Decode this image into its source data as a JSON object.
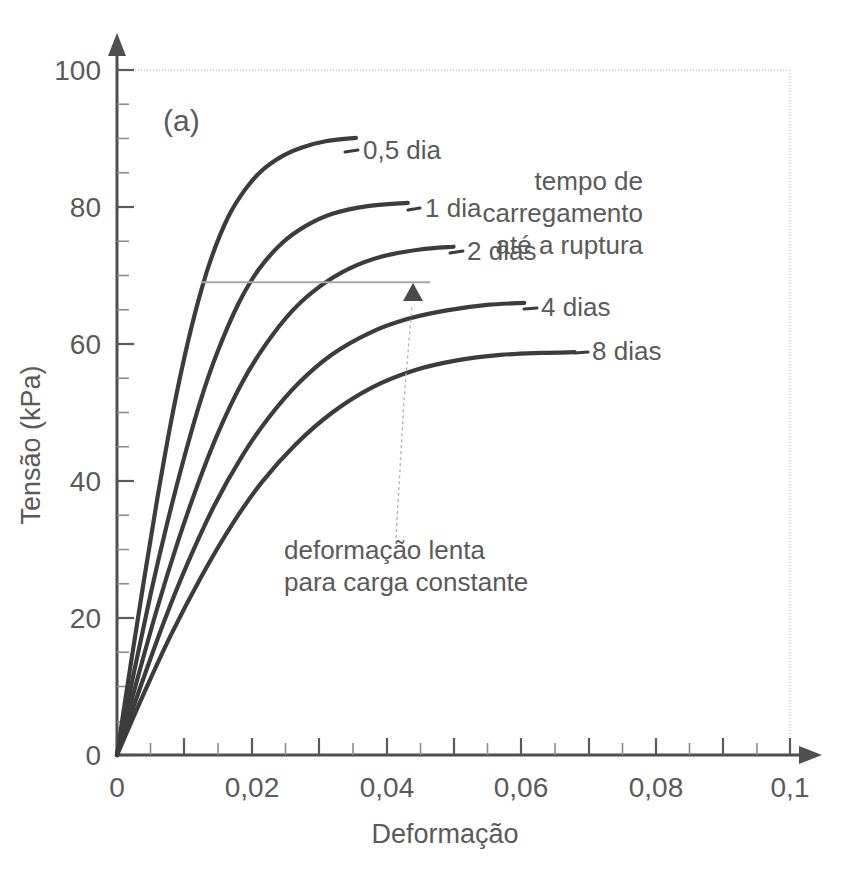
{
  "figure": {
    "panel_label": "(a)",
    "background_color": "#ffffff",
    "ink_color": "#4a4a4a"
  },
  "chart_data": {
    "type": "line",
    "title": "",
    "subtitle": "",
    "panel": "(a)",
    "xlabel": "Deformação",
    "ylabel": "Tensão (kPa)",
    "xlim": [
      0,
      0.1
    ],
    "ylim": [
      0,
      100
    ],
    "x_major_ticks": [
      0,
      0.02,
      0.04,
      0.06,
      0.08,
      0.1
    ],
    "x_major_tick_labels": [
      "0",
      "0,02",
      "0,04",
      "0,06",
      "0,08",
      "0,1"
    ],
    "x_minor_tick_step": 0.005,
    "y_major_ticks": [
      0,
      20,
      40,
      60,
      80,
      100
    ],
    "y_major_tick_labels": [
      "0",
      "20",
      "40",
      "60",
      "80",
      "100"
    ],
    "y_minor_tick_step": 5,
    "grid": false,
    "legend": "inline-curve-labels",
    "series": [
      {
        "name": "0,5 dia",
        "label": "0,5 dia",
        "color": "#3c3c3c",
        "peak_stress": 90,
        "peak_strain": 0.0355,
        "points": [
          [
            0.0,
            0.0
          ],
          [
            0.002,
            13.0
          ],
          [
            0.004,
            25.5
          ],
          [
            0.006,
            37.5
          ],
          [
            0.008,
            48.5
          ],
          [
            0.01,
            58.0
          ],
          [
            0.012,
            66.0
          ],
          [
            0.014,
            72.5
          ],
          [
            0.0165,
            78.5
          ],
          [
            0.019,
            82.5
          ],
          [
            0.0215,
            85.3
          ],
          [
            0.0245,
            87.4
          ],
          [
            0.0275,
            88.7
          ],
          [
            0.031,
            89.6
          ],
          [
            0.0355,
            90.1
          ]
        ]
      },
      {
        "name": "1 dia",
        "label": "1 dia",
        "color": "#3c3c3c",
        "peak_stress": 80.5,
        "peak_strain": 0.0432,
        "points": [
          [
            0.0,
            0.0
          ],
          [
            0.0025,
            12.0
          ],
          [
            0.005,
            23.5
          ],
          [
            0.0075,
            34.0
          ],
          [
            0.01,
            43.5
          ],
          [
            0.0125,
            52.0
          ],
          [
            0.015,
            59.0
          ],
          [
            0.018,
            65.8
          ],
          [
            0.021,
            70.8
          ],
          [
            0.0245,
            74.7
          ],
          [
            0.028,
            77.2
          ],
          [
            0.032,
            79.0
          ],
          [
            0.037,
            80.1
          ],
          [
            0.0432,
            80.6
          ]
        ]
      },
      {
        "name": "2 dias",
        "label": "2 dias",
        "color": "#3c3c3c",
        "peak_stress": 74.2,
        "peak_strain": 0.05,
        "points": [
          [
            0.0,
            0.0
          ],
          [
            0.003,
            11.0
          ],
          [
            0.006,
            21.5
          ],
          [
            0.009,
            31.0
          ],
          [
            0.012,
            39.5
          ],
          [
            0.015,
            47.0
          ],
          [
            0.0185,
            54.2
          ],
          [
            0.022,
            59.8
          ],
          [
            0.026,
            64.8
          ],
          [
            0.03,
            68.3
          ],
          [
            0.0345,
            71.0
          ],
          [
            0.0395,
            72.8
          ],
          [
            0.045,
            73.8
          ],
          [
            0.05,
            74.2
          ]
        ]
      },
      {
        "name": "4 dias",
        "label": "4 dias",
        "color": "#3c3c3c",
        "peak_stress": 66.0,
        "peak_strain": 0.0605,
        "points": [
          [
            0.0,
            0.0
          ],
          [
            0.0035,
            10.0
          ],
          [
            0.007,
            19.5
          ],
          [
            0.0105,
            28.0
          ],
          [
            0.0145,
            36.5
          ],
          [
            0.0185,
            43.5
          ],
          [
            0.0225,
            49.2
          ],
          [
            0.027,
            54.3
          ],
          [
            0.032,
            58.5
          ],
          [
            0.0375,
            61.6
          ],
          [
            0.043,
            63.6
          ],
          [
            0.049,
            64.9
          ],
          [
            0.055,
            65.7
          ],
          [
            0.0605,
            66.0
          ]
        ]
      },
      {
        "name": "8 dias",
        "label": "8 dias",
        "color": "#3c3c3c",
        "peak_stress": 58.8,
        "peak_strain": 0.068,
        "points": [
          [
            0.0,
            0.0
          ],
          [
            0.004,
            9.0
          ],
          [
            0.008,
            17.5
          ],
          [
            0.0125,
            26.0
          ],
          [
            0.017,
            33.5
          ],
          [
            0.0215,
            39.8
          ],
          [
            0.0265,
            45.3
          ],
          [
            0.032,
            50.0
          ],
          [
            0.038,
            53.7
          ],
          [
            0.044,
            56.1
          ],
          [
            0.0505,
            57.6
          ],
          [
            0.057,
            58.4
          ],
          [
            0.063,
            58.7
          ],
          [
            0.068,
            58.8
          ]
        ]
      }
    ],
    "reference_line": {
      "type": "horizontal",
      "y_value": 69,
      "x_start": 0.0125,
      "x_end": 0.0465,
      "color": "#a7a7a7"
    },
    "annotations": [
      {
        "id": "creep-note",
        "lines": [
          "deformação lenta",
          "para carga constante"
        ],
        "x": 0.0385,
        "y": 30
      },
      {
        "id": "time-to-failure-note",
        "lines": [
          "tempo de",
          "carregamento",
          "até a ruptura"
        ],
        "x": 0.076,
        "y": 84
      }
    ],
    "callout_arrow": {
      "from_x": 0.0385,
      "from_y": 33,
      "to_x": 0.0405,
      "to_y": 68,
      "style": "dashed-with-arrowhead"
    },
    "bounding_box": {
      "top_y": 100,
      "right_x": 0.1,
      "color": "#d8d8d8",
      "style": "dotted"
    }
  }
}
